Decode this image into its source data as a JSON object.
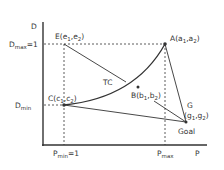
{
  "axes": {
    "y_label": "D",
    "x_label": "P",
    "y_ticks": [
      {
        "main": "D",
        "sub": "max",
        "suffix": "=1"
      },
      {
        "main": "D",
        "sub": "min",
        "suffix": ""
      }
    ],
    "x_ticks": [
      {
        "main": "P",
        "sub": "min",
        "suffix": "=1"
      },
      {
        "main": "P",
        "sub": "max",
        "suffix": ""
      }
    ]
  },
  "points": {
    "E": {
      "name": "E",
      "coords": [
        "e",
        "1",
        "e",
        "2"
      ]
    },
    "A": {
      "name": "A",
      "coords": [
        "a",
        "1",
        "a",
        "2"
      ]
    },
    "C": {
      "name": "C",
      "coords": [
        "c",
        "1",
        "c",
        "2"
      ]
    },
    "B": {
      "name": "B",
      "coords": [
        "b",
        "1",
        "b",
        "2"
      ]
    },
    "G": {
      "name": "G",
      "coords": [
        "g",
        "1",
        "g",
        "2"
      ],
      "caption": "Goal"
    }
  },
  "curve_label": "TC",
  "colors": {
    "ink": "#333333",
    "background": "#ffffff"
  }
}
